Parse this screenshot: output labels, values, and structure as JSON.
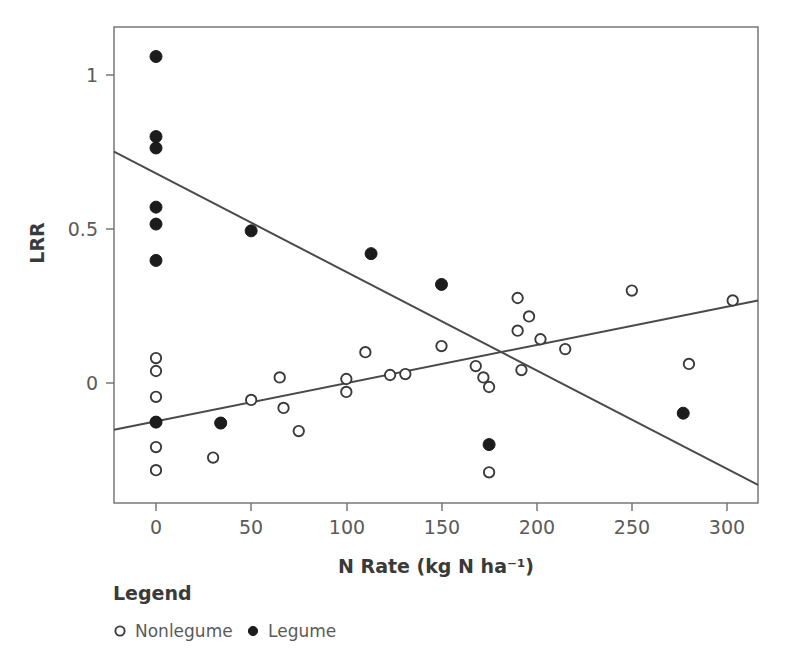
{
  "chart_data": {
    "type": "scatter",
    "title": "",
    "xlabel": "N Rate (kg N ha⁻¹)",
    "ylabel": "LRR",
    "xlim": [
      -25,
      325
    ],
    "ylim": [
      -0.36,
      1.17
    ],
    "xticks": [
      0,
      50,
      100,
      150,
      200,
      250,
      300
    ],
    "xticklabels": [
      "0",
      "50",
      "100",
      "150",
      "200",
      "250",
      "300"
    ],
    "yticks": [
      0,
      0.5,
      1
    ],
    "yticklabels": [
      "0",
      "0.5",
      "1"
    ],
    "grid": false,
    "frame": true,
    "legend": {
      "title": "Legend",
      "position": "below-left",
      "entries": [
        {
          "label": "Nonlegume",
          "marker": "open-circle"
        },
        {
          "label": "Legume",
          "marker": "filled-circle"
        }
      ]
    },
    "series": [
      {
        "name": "Nonlegume",
        "marker": "open-circle",
        "color": "#3a3a3a",
        "points": [
          {
            "x": 0,
            "y": 0.081
          },
          {
            "x": 0,
            "y": 0.039
          },
          {
            "x": 0,
            "y": -0.045
          },
          {
            "x": 0,
            "y": -0.127
          },
          {
            "x": 0,
            "y": -0.208
          },
          {
            "x": 0,
            "y": -0.283
          },
          {
            "x": 30,
            "y": -0.242
          },
          {
            "x": 34,
            "y": -0.13
          },
          {
            "x": 50,
            "y": -0.055
          },
          {
            "x": 65,
            "y": 0.018
          },
          {
            "x": 67,
            "y": -0.081
          },
          {
            "x": 75,
            "y": -0.156
          },
          {
            "x": 100,
            "y": 0.013
          },
          {
            "x": 100,
            "y": -0.029
          },
          {
            "x": 110,
            "y": 0.1
          },
          {
            "x": 123,
            "y": 0.026
          },
          {
            "x": 131,
            "y": 0.029
          },
          {
            "x": 150,
            "y": 0.12
          },
          {
            "x": 168,
            "y": 0.055
          },
          {
            "x": 172,
            "y": 0.018
          },
          {
            "x": 175,
            "y": -0.013
          },
          {
            "x": 190,
            "y": 0.276
          },
          {
            "x": 190,
            "y": 0.17
          },
          {
            "x": 192,
            "y": 0.042
          },
          {
            "x": 196,
            "y": 0.216
          },
          {
            "x": 202,
            "y": 0.142
          },
          {
            "x": 215,
            "y": 0.11
          },
          {
            "x": 175,
            "y": -0.29
          },
          {
            "x": 250,
            "y": 0.3
          },
          {
            "x": 280,
            "y": 0.062
          },
          {
            "x": 303,
            "y": 0.268
          }
        ]
      },
      {
        "name": "Legume",
        "marker": "filled-circle",
        "color": "#1c1c1c",
        "points": [
          {
            "x": 0,
            "y": 1.06
          },
          {
            "x": 0,
            "y": 0.8
          },
          {
            "x": 0,
            "y": 0.763
          },
          {
            "x": 0,
            "y": 0.571
          },
          {
            "x": 0,
            "y": 0.516
          },
          {
            "x": 0,
            "y": 0.398
          },
          {
            "x": 0,
            "y": -0.127
          },
          {
            "x": 34,
            "y": -0.13
          },
          {
            "x": 50,
            "y": 0.494
          },
          {
            "x": 113,
            "y": 0.42
          },
          {
            "x": 150,
            "y": 0.32
          },
          {
            "x": 175,
            "y": -0.2
          },
          {
            "x": 277,
            "y": -0.098
          }
        ]
      }
    ],
    "fit_lines": [
      {
        "name": "Nonlegume trend",
        "for_series": "Nonlegume",
        "x_start": -25,
        "y_start": -0.152,
        "x_end": 325,
        "y_end": 0.268
      },
      {
        "name": "Legume trend",
        "for_series": "Legume",
        "x_start": -25,
        "y_start": 0.751,
        "x_end": 325,
        "y_end": -0.331
      }
    ]
  }
}
